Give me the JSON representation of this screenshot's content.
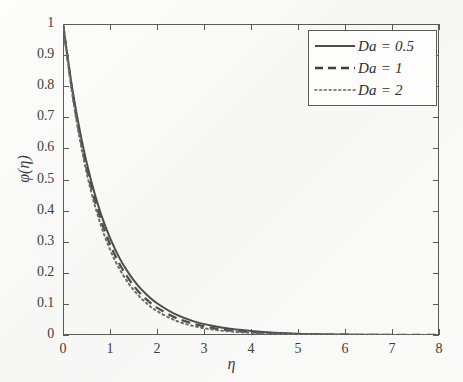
{
  "chart_data": {
    "type": "line",
    "title": "",
    "xlabel": "η",
    "ylabel": "φ(η)",
    "xlim": [
      0,
      8
    ],
    "ylim": [
      0,
      1
    ],
    "grid": false,
    "legend_position": "top-right",
    "xticks": [
      "0",
      "1",
      "2",
      "3",
      "4",
      "5",
      "6",
      "7",
      "8"
    ],
    "yticks": [
      "0",
      "0.1",
      "0.2",
      "0.3",
      "0.4",
      "0.5",
      "0.6",
      "0.7",
      "0.8",
      "0.9",
      "1"
    ],
    "x": [
      0,
      0.2,
      0.4,
      0.6,
      0.8,
      1.0,
      1.2,
      1.4,
      1.6,
      1.8,
      2.0,
      2.4,
      2.8,
      3.2,
      3.6,
      4.0,
      4.5,
      5.0,
      5.5,
      6.0,
      6.5,
      7.0,
      7.5,
      8.0
    ],
    "series": [
      {
        "name": "Da = 0.5",
        "style": "solid",
        "color": "#4d4d4d",
        "values": [
          1.0,
          0.79,
          0.625,
          0.495,
          0.392,
          0.312,
          0.248,
          0.198,
          0.158,
          0.127,
          0.102,
          0.066,
          0.043,
          0.029,
          0.019,
          0.013,
          0.0075,
          0.0042,
          0.0024,
          0.0014,
          0.0008,
          0.0004,
          0.0002,
          0.0
        ]
      },
      {
        "name": "Da = 1",
        "style": "dashed",
        "color": "#4d4d4d",
        "values": [
          1.0,
          0.78,
          0.609,
          0.476,
          0.373,
          0.292,
          0.229,
          0.18,
          0.141,
          0.111,
          0.088,
          0.055,
          0.035,
          0.022,
          0.014,
          0.0095,
          0.0053,
          0.0029,
          0.0016,
          0.0009,
          0.0005,
          0.0003,
          0.0001,
          0.0
        ]
      },
      {
        "name": "Da = 2",
        "style": "dotted",
        "color": "#6b6b6b",
        "values": [
          1.0,
          0.772,
          0.596,
          0.46,
          0.356,
          0.275,
          0.213,
          0.165,
          0.128,
          0.099,
          0.077,
          0.046,
          0.028,
          0.017,
          0.011,
          0.0068,
          0.0036,
          0.0019,
          0.001,
          0.0005,
          0.0003,
          0.0002,
          0.0001,
          0.0
        ]
      }
    ],
    "legend_entries": [
      {
        "label": "Da = 0.5",
        "style": "solid"
      },
      {
        "label": "Da = 1",
        "style": "dashed"
      },
      {
        "label": "Da = 2",
        "style": "dotted"
      }
    ]
  },
  "axes": {
    "x_label": "η",
    "y_label": "φ(η)"
  }
}
